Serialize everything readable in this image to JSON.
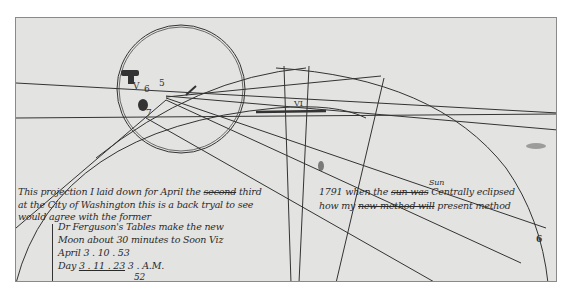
{
  "document": {
    "type": "manuscript-projection",
    "labels": {
      "v": "V",
      "six": "6",
      "five": "5",
      "seven": "7",
      "vi": "VI",
      "six_right": "6"
    },
    "text_lines": {
      "line1_a": "This projection I laid down for April the",
      "line1_strike": "second",
      "line1_b": "third",
      "line1_c": "1791 when the",
      "line1_strike2": "sun was",
      "line1_d": "Centrally eclipsed",
      "insert_above": "Sun",
      "line2_a": "at the City of Washington",
      "line2_b": "this is a back tryal to see",
      "line2_c": "how my",
      "line2_strike": "new method will",
      "line2_d": "present method",
      "line3": "would agree with the former",
      "note1": "Dr Ferguson's Tables make the new",
      "note2": "Moon about 30 minutes to Soon Viz",
      "note3_label": "April",
      "note3_val": "3 . 10 . 53",
      "note4_label": "Day",
      "note4_val": "3 . 11 . 23",
      "note4_suffix": "3 . A.M.",
      "note5": "52"
    }
  }
}
